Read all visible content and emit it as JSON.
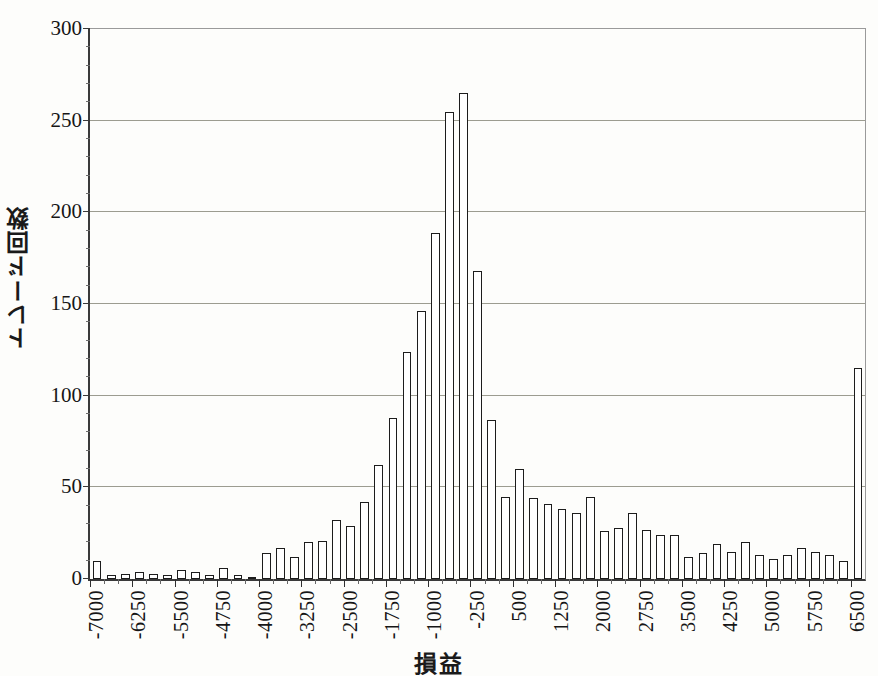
{
  "chart_data": {
    "type": "bar",
    "title": "",
    "xlabel": "損益",
    "ylabel": "トレード回数",
    "ylim": [
      0,
      300
    ],
    "ytick_values": [
      0,
      50,
      100,
      150,
      200,
      250,
      300
    ],
    "ytick_labels": [
      "0",
      "50",
      "100",
      "150",
      "200",
      "250",
      "300"
    ],
    "y_minor_step": 10,
    "grid": "horizontal",
    "legend": "none",
    "bin_width": 250,
    "xtick_labels": [
      "-7000",
      "-6250",
      "-5500",
      "-4750",
      "-4000",
      "-3250",
      "-2500",
      "-1750",
      "-1000",
      "-250",
      "500",
      "1250",
      "2000",
      "2750",
      "3500",
      "4250",
      "5000",
      "5750",
      "6500"
    ],
    "xtick_label_step_bins": 3,
    "categories": [
      "-7000",
      "-6750",
      "-6500",
      "-6250",
      "-6000",
      "-5750",
      "-5500",
      "-5250",
      "-5000",
      "-4750",
      "-4500",
      "-4250",
      "-4000",
      "-3750",
      "-3500",
      "-3250",
      "-3000",
      "-2750",
      "-2500",
      "-2250",
      "-2000",
      "-1750",
      "-1500",
      "-1250",
      "-1000",
      "-750",
      "-500",
      "-250",
      "0",
      "250",
      "500",
      "750",
      "1000",
      "1250",
      "1500",
      "1750",
      "2000",
      "2250",
      "2500",
      "2750",
      "3000",
      "3250",
      "3500",
      "3750",
      "4000",
      "4250",
      "4500",
      "4750",
      "5000",
      "5250",
      "5500",
      "5750",
      "6000",
      "6250",
      "6500"
    ],
    "values": [
      10,
      2,
      3,
      4,
      3,
      2,
      5,
      4,
      2,
      6,
      2,
      1,
      14,
      17,
      12,
      20,
      21,
      32,
      29,
      42,
      62,
      88,
      124,
      146,
      189,
      255,
      265,
      168,
      87,
      45,
      60,
      44,
      41,
      38,
      36,
      45,
      26,
      28,
      36,
      27,
      24,
      24,
      12,
      14,
      19,
      15,
      20,
      13,
      11,
      13,
      17,
      15,
      13,
      10,
      115
    ],
    "series_name": "トレード回数"
  },
  "axes": {
    "y_title": "トレード回数",
    "x_title": "損益"
  }
}
